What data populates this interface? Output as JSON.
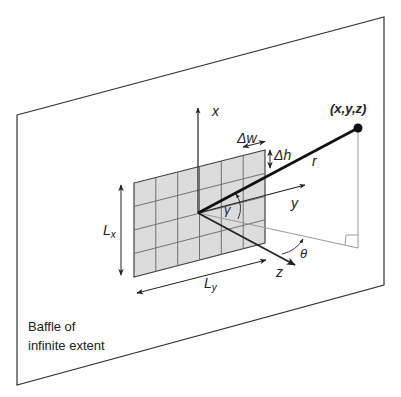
{
  "diagram": {
    "baffle_label_line1": "Baffle of",
    "baffle_label_line2": "infinite extent",
    "point_label": "(x,y,z)",
    "axes": {
      "x_label": "x",
      "y_label": "y",
      "z_label": "z"
    },
    "vector_label": "r",
    "angle_gamma": "γ",
    "angle_theta": "θ",
    "element_width_label": "Δw",
    "element_height_label": "Δh",
    "array_height_label": {
      "main": "L",
      "sub": "x"
    },
    "array_width_label": {
      "main": "L",
      "sub": "y"
    },
    "grid": {
      "columns": 6,
      "rows": 4
    },
    "colors": {
      "panel_fill": "#dcdcdc",
      "grid_line": "#666666",
      "outline": "#333333",
      "thin_line": "#9a9a9a",
      "point": "#111111"
    }
  }
}
